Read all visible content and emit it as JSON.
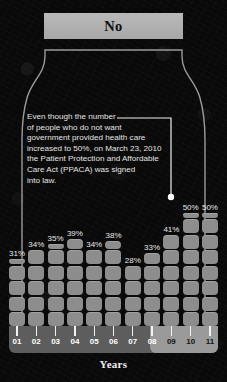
{
  "header": {
    "title": "No"
  },
  "annotation": {
    "text": "Even though the number\nof people who do not want\ngovernment provided health care\nincreased to 50%, on March 23, 2010\nthe Patient Protection and Affordable\nCare Act (PPACA) was signed\ninto law."
  },
  "axis": {
    "caption": "Years"
  },
  "colors": {
    "background": "#090909",
    "bar": "#8d8d8d",
    "header_box": "#b9b9b9",
    "axis_base": "#5d5d5d",
    "axis_highlight": "#9a9a9a",
    "text": "#e8e8e8",
    "outline": "#9b9b9b"
  },
  "chart_data": {
    "type": "bar",
    "title": "No",
    "xlabel": "Years",
    "ylabel": "",
    "ylim": [
      0,
      55
    ],
    "grid": false,
    "legend": "none",
    "categories": [
      "01",
      "02",
      "03",
      "04",
      "05",
      "06",
      "07",
      "08",
      "09",
      "10",
      "11"
    ],
    "values": [
      31,
      34,
      35,
      39,
      34,
      38,
      28,
      33,
      41,
      50,
      50
    ],
    "data_labels": [
      "31%",
      "34%",
      "35%",
      "39%",
      "34%",
      "38%",
      "28%",
      "33%",
      "41%",
      "50%",
      "50%"
    ],
    "highlighted_categories": [
      "09",
      "10",
      "11"
    ],
    "annotations": [
      {
        "text": "Even though the number of people who do not want government provided health care increased to 50%, on March 23, 2010 the Patient Protection and Affordable Care Act (PPACA) was signed into law.",
        "points_to": "10"
      }
    ]
  }
}
